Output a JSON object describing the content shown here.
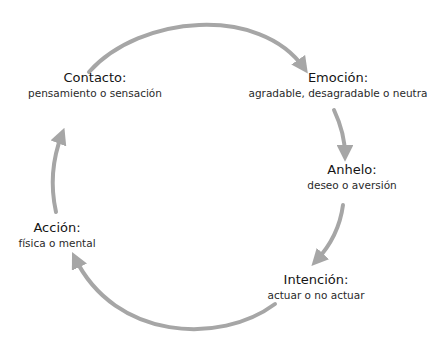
{
  "diagram": {
    "type": "cycle",
    "arrow_color": "#a6a6a6",
    "nodes": [
      {
        "id": "contacto",
        "title": "Contacto:",
        "subtitle": "pensamiento o sensación"
      },
      {
        "id": "emocion",
        "title": "Emoción:",
        "subtitle": "agradable, desagradable o neutra"
      },
      {
        "id": "anhelo",
        "title": "Anhelo:",
        "subtitle": "deseo o aversión"
      },
      {
        "id": "intencion",
        "title": "Intención:",
        "subtitle": "actuar o no actuar"
      },
      {
        "id": "accion",
        "title": "Acción:",
        "subtitle": "física o mental"
      }
    ],
    "edges": [
      {
        "from": "contacto",
        "to": "emocion"
      },
      {
        "from": "emocion",
        "to": "anhelo"
      },
      {
        "from": "anhelo",
        "to": "intencion"
      },
      {
        "from": "intencion",
        "to": "accion"
      },
      {
        "from": "accion",
        "to": "contacto"
      }
    ]
  }
}
